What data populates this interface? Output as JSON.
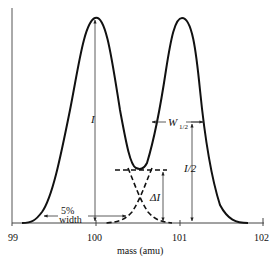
{
  "figure": {
    "x_axis": {
      "label": "mass (amu)",
      "ticks": [
        "99",
        "100",
        "101",
        "102"
      ]
    },
    "annotations": {
      "peak_height": "I",
      "half_height": "I/2",
      "half_width_main": "W",
      "half_width_sub": "1/2",
      "valley_delta": "ΔI",
      "five_pct_line1": "5%",
      "five_pct_line2": "width"
    },
    "colors": {
      "curve": "#111111",
      "guides": "#333333"
    }
  }
}
